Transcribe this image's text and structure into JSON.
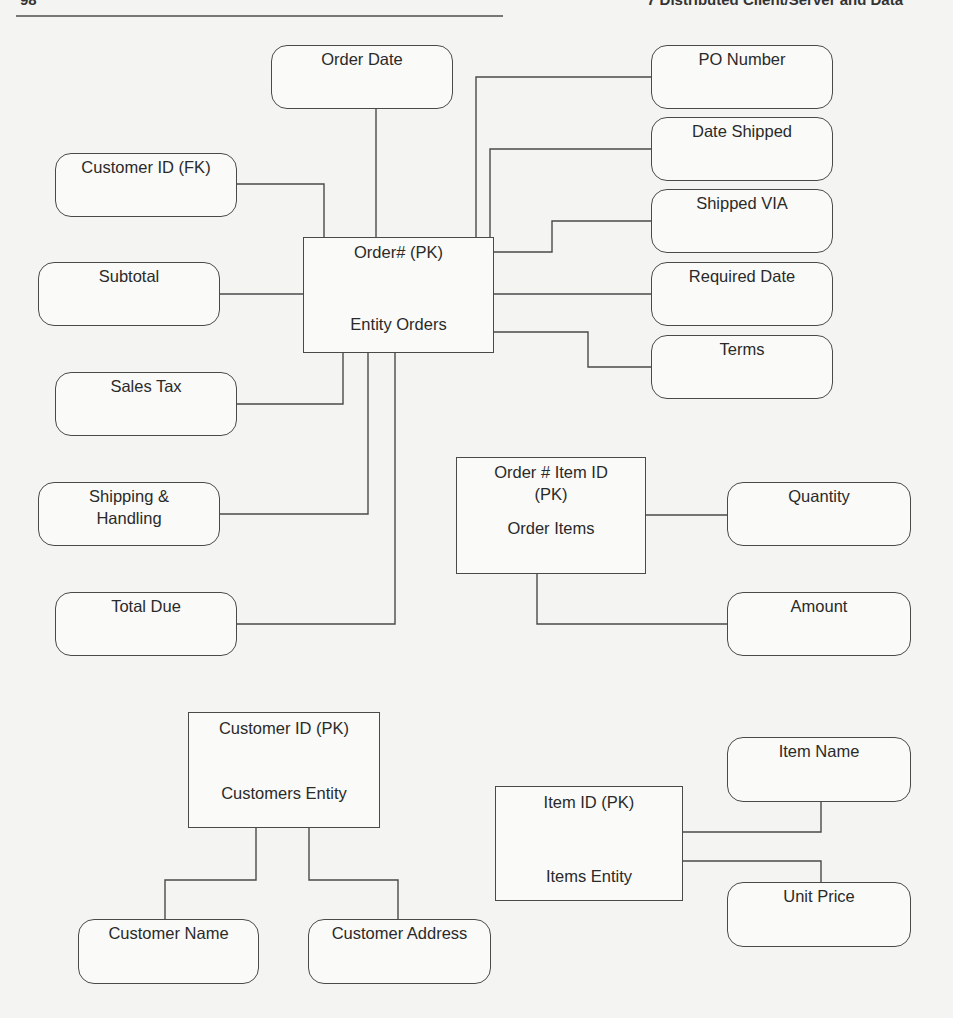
{
  "page": {
    "page_number": "98",
    "running_title": "7   Distributed Client/Server and Data",
    "line_color": "#4a4a4a",
    "background": "#f4f4f2"
  },
  "diagram": {
    "type": "entity-relationship",
    "entities": {
      "orders": {
        "key": "Order# (PK)",
        "name": "Entity Orders"
      },
      "order_items": {
        "key": "Order # Item ID\n(PK)",
        "key_line1": "Order # Item ID",
        "key_line2": "(PK)",
        "name": "Order Items"
      },
      "customers": {
        "key": "Customer ID (PK)",
        "name": "Customers Entity"
      },
      "items": {
        "key": "Item ID (PK)",
        "name": "Items Entity"
      }
    },
    "attributes": {
      "order_date": "Order Date",
      "customer_id_fk": "Customer ID (FK)",
      "subtotal": "Subtotal",
      "sales_tax": "Sales Tax",
      "shipping_line1": "Shipping &",
      "shipping_line2": "Handling",
      "total_due": "Total Due",
      "po_number": "PO Number",
      "date_shipped": "Date Shipped",
      "shipped_via": "Shipped VIA",
      "required_date": "Required Date",
      "terms": "Terms",
      "quantity": "Quantity",
      "amount": "Amount",
      "customer_name": "Customer Name",
      "customer_address": "Customer Address",
      "item_name": "Item Name",
      "unit_price": "Unit Price"
    },
    "relationships": [
      {
        "entity": "Entity Orders",
        "attributes": [
          "Order Date",
          "Customer ID (FK)",
          "Subtotal",
          "Sales Tax",
          "Shipping & Handling",
          "Total Due",
          "PO Number",
          "Date Shipped",
          "Shipped VIA",
          "Required Date",
          "Terms"
        ]
      },
      {
        "entity": "Order Items",
        "attributes": [
          "Quantity",
          "Amount"
        ]
      },
      {
        "entity": "Customers Entity",
        "attributes": [
          "Customer Name",
          "Customer Address"
        ]
      },
      {
        "entity": "Items Entity",
        "attributes": [
          "Item Name",
          "Unit Price"
        ]
      }
    ]
  }
}
